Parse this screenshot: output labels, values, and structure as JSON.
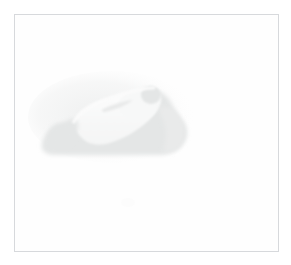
{
  "image": {
    "kind": "photograph",
    "description": "Extremely faded, low-contrast photograph of a racing motorcycle with a leaning rider, rendered as a pale gray silhouette on a near-white background.",
    "subject": "motorcycle-and-rider-silhouette",
    "visible_text": "",
    "background_color": "#fefefe",
    "page_color": "#ffffff",
    "frame": {
      "border_color": "#d7d9dc",
      "border_width_px": 1,
      "left_px": 14,
      "top_px": 14,
      "width_px": 265,
      "height_px": 238
    },
    "silhouette": {
      "shadow_color": "#e4e6e6",
      "body_color": "#eff0f0",
      "highlight_color": "#fbfbfb",
      "outline_color": "#e9eaea",
      "bounds_px": {
        "x": 34,
        "y": 74,
        "width": 148,
        "height": 84
      }
    },
    "blemish": {
      "color": "#fcfcfc",
      "x_px": 106,
      "y_px": 183,
      "width_px": 14,
      "height_px": 9
    }
  }
}
